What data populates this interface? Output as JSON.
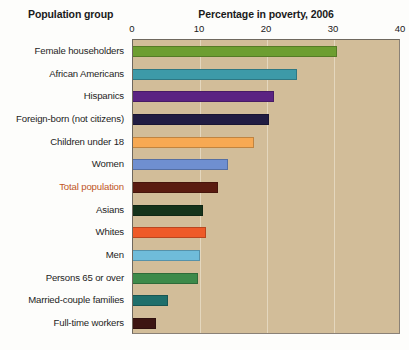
{
  "headings": {
    "group": "Population group",
    "value": "Percentage in poverty, 2006"
  },
  "colors": {
    "plot_background": "#d2bd99",
    "gridline": "#e8dcc4",
    "page_background": "#fdfdfb",
    "highlight_label": "#c0561f",
    "axis_text": "#1a1a1a"
  },
  "chart_data": {
    "type": "bar",
    "orientation": "horizontal",
    "title": "Percentage in poverty, 2006",
    "xlabel": "Percentage in poverty, 2006",
    "ylabel": "Population group",
    "xlim": [
      0,
      40
    ],
    "xticks": [
      0,
      10,
      20,
      30,
      40
    ],
    "xtick_labels": [
      "0",
      "10",
      "20",
      "30",
      "40"
    ],
    "grid": true,
    "grid_axis": "x",
    "legend": false,
    "categories": [
      "Female householders",
      "African Americans",
      "Hispanics",
      "Foreign-born (not citizens)",
      "Children under 18",
      "Women",
      "Total population",
      "Asians",
      "Whites",
      "Men",
      "Persons 65 or over",
      "Married-couple families",
      "Full-time workers"
    ],
    "values": [
      30.5,
      24.5,
      21.0,
      20.3,
      18.0,
      14.2,
      12.7,
      10.4,
      10.9,
      10.0,
      9.7,
      5.2,
      3.4
    ],
    "bar_colors": [
      "#6d9e30",
      "#3d9aa8",
      "#5b2382",
      "#211c42",
      "#f7a953",
      "#6f8fd0",
      "#5a1b10",
      "#15331b",
      "#ee5a28",
      "#6fbcda",
      "#3d8a4a",
      "#1f6f6b",
      "#3d1512"
    ],
    "highlighted_category": "Total population"
  }
}
